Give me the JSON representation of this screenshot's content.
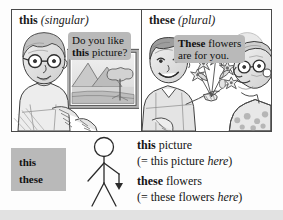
{
  "panels": {
    "left": {
      "heading_word": "this",
      "heading_note": "(singular)",
      "bubble_line1": "Do you like",
      "bubble_line2_bold": "this",
      "bubble_line2_rest": " picture?",
      "scene": "man-with-glasses-pointing-at-framed-landscape-picture"
    },
    "right": {
      "heading_word": "these",
      "heading_note": "(plural)",
      "bubble_line1_bold": "These",
      "bubble_line1_rest": " flowers",
      "bubble_line2": "are for you.",
      "scene": "young-man-giving-flowers-to-older-woman"
    }
  },
  "keyword_box": {
    "singular": "this",
    "plural": "these"
  },
  "stick_figure": {
    "label": "stick-figure-pointing-down",
    "arrow": "downward-arrow"
  },
  "examples": [
    {
      "bold": "this",
      "rest": " picture"
    },
    {
      "prefix": "(= this picture ",
      "italic": "here",
      "suffix": ")"
    },
    {
      "bold": "these",
      "rest": " flowers"
    },
    {
      "prefix": "(= these flowers ",
      "italic": "here",
      "suffix": ")"
    }
  ],
  "colors": {
    "bubble_grey": "#b9b9b9",
    "keybox_grey": "#b9b9b9",
    "border": "#4a4a4a",
    "page": "#fdfdfd",
    "band": "#e2e2e2"
  }
}
